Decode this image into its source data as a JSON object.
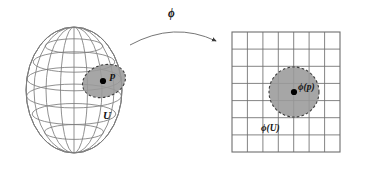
{
  "figure": {
    "kind": "manifold-chart-diagram",
    "background_color": "#ffffff",
    "width": 370,
    "height": 169,
    "labels": {
      "point_on_manifold": "p",
      "neighborhood": "U",
      "map": "ϕ",
      "image_of_point": "ϕ(p)",
      "image_of_neighborhood": "ϕ(U)"
    },
    "colors": {
      "patch_fill": "#9a9a9a",
      "patch_stroke": "#4a4a4a",
      "sphere_stroke": "#7d7d7d",
      "grid_stroke": "#6e6e6e",
      "dot_fill": "#000000",
      "arrow_stroke": "#555555",
      "text": "#141414"
    },
    "sphere": {
      "center_x": 74,
      "center_y": 90,
      "radius_x": 48,
      "radius_y": 63,
      "meridian_count": 7,
      "parallel_count": 5
    },
    "chart_grid": {
      "left": 232,
      "top": 32,
      "right": 340,
      "bottom": 152,
      "columns": 7,
      "rows": 7
    },
    "patch_ellipse": {
      "center_x": 104,
      "center_y": 81,
      "radius_x": 22,
      "radius_y": 16,
      "rotation_deg": -18,
      "border_style": "dashed"
    },
    "patch_circle": {
      "center_x": 294,
      "center_y": 92,
      "radius": 25,
      "border_style": "dashed"
    },
    "arrow": {
      "start_x": 130,
      "start_y": 44,
      "control_x": 174,
      "control_y": 22,
      "end_x": 218,
      "end_y": 42,
      "arrowhead": "small-filled-triangle"
    }
  }
}
